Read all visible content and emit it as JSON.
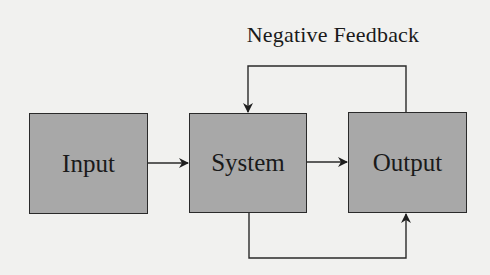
{
  "diagram": {
    "title": "Negative Feedback",
    "nodes": [
      {
        "id": "input",
        "label": "Input"
      },
      {
        "id": "system",
        "label": "System"
      },
      {
        "id": "output",
        "label": "Output"
      }
    ],
    "edges": [
      {
        "from": "input",
        "to": "system",
        "label": ""
      },
      {
        "from": "system",
        "to": "output",
        "label": ""
      },
      {
        "from": "output",
        "to": "system",
        "label": "Negative Feedback",
        "route": "top"
      },
      {
        "from": "system",
        "to": "output",
        "label": "",
        "route": "bottom"
      }
    ],
    "colors": {
      "box_fill": "#a8a8a8",
      "stroke": "#2a2a2a",
      "background": "#f1f1ef"
    }
  }
}
